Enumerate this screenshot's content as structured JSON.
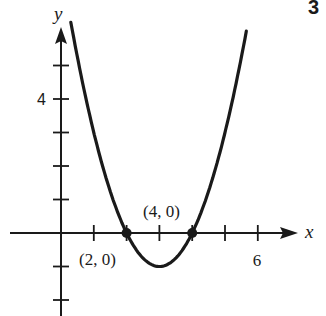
{
  "problem_number": "3",
  "chart_data": {
    "type": "line",
    "title": "",
    "function": "y = (x - 2)(x - 4)",
    "xlabel": "x",
    "ylabel": "y",
    "xlim": [
      -1.6,
      7.2
    ],
    "ylim": [
      -2.5,
      6.3
    ],
    "x_ticks": [
      1,
      2,
      3,
      4,
      5,
      6
    ],
    "y_ticks": [
      -2,
      -1,
      1,
      2,
      3,
      4,
      5
    ],
    "x_tick_labels": [
      {
        "x": 6,
        "label": "6"
      }
    ],
    "y_tick_labels": [
      {
        "y": 4,
        "label": "4"
      }
    ],
    "grid": false,
    "series": [
      {
        "name": "parabola",
        "x": [
          0.3,
          0.5,
          1,
          1.5,
          2,
          2.5,
          3,
          3.5,
          4,
          4.5,
          5,
          5.5,
          5.65
        ],
        "y": [
          6.29,
          5.25,
          3,
          1.25,
          0,
          -0.75,
          -1,
          -0.75,
          0,
          1.25,
          3,
          5.25,
          6.02
        ]
      }
    ],
    "annotations": [
      {
        "point": [
          2,
          0
        ],
        "label": "(2, 0)",
        "marker": "dot"
      },
      {
        "point": [
          4,
          0
        ],
        "label": "(4, 0)",
        "marker": "dot"
      }
    ]
  }
}
